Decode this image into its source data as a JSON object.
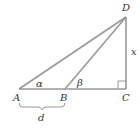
{
  "diagram": {
    "type": "right-triangle-geometry",
    "stroke_color": "#999999",
    "text_color": "#333333",
    "points": {
      "A": {
        "label": "A",
        "x": 19,
        "y": 89
      },
      "B": {
        "label": "B",
        "x": 65,
        "y": 89
      },
      "C": {
        "label": "C",
        "x": 126,
        "y": 89
      },
      "D": {
        "label": "D",
        "x": 126,
        "y": 17
      }
    },
    "angles": {
      "alpha": {
        "label": "α",
        "at": "A"
      },
      "beta": {
        "label": "β",
        "at": "B"
      }
    },
    "lengths": {
      "x": {
        "label": "x",
        "segment": "CD"
      },
      "d": {
        "label": "d",
        "segment": "AB"
      }
    },
    "right_angle_at": "C"
  }
}
